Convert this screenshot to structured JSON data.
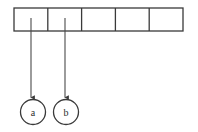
{
  "figure": {
    "kind": "array-with-pointer-nodes-diagram",
    "canvas": {
      "width": 198,
      "height": 132,
      "background": "#ffffff"
    },
    "style": {
      "stroke_color": "#3a3a3a",
      "stroke_color_light": "#4a4a4a",
      "cell_fill": "#ffffff",
      "node_fill": "#ffffff",
      "label_color": "#2e2e2e",
      "stroke_width": 1.3,
      "pointer_stroke_width": 1.1,
      "label_font_size": 10
    },
    "array": {
      "name": "slot-array",
      "x": 14,
      "y": 8,
      "width": 169,
      "height": 23,
      "cell_count": 5,
      "cell_width": 33.8,
      "divider_x": [
        47.8,
        81.6,
        115.4,
        149.2
      ],
      "cells": [
        {
          "index": 0,
          "label": "",
          "center_x": 30.9
        },
        {
          "index": 1,
          "label": "",
          "center_x": 64.7
        },
        {
          "index": 2,
          "label": "",
          "center_x": 98.5
        },
        {
          "index": 3,
          "label": "",
          "center_x": 132.3
        },
        {
          "index": 4,
          "label": "",
          "center_x": 166.1
        }
      ]
    },
    "pointers": [
      {
        "name": "pointer-arrow-a",
        "from_cell_index": 0,
        "x": 31,
        "y_start": 18,
        "y_end": 98,
        "arrowhead": "down",
        "target_node": "a"
      },
      {
        "name": "pointer-arrow-b",
        "from_cell_index": 1,
        "x": 65,
        "y_start": 18,
        "y_end": 98,
        "arrowhead": "down",
        "target_node": "b"
      }
    ],
    "nodes": [
      {
        "name": "node-a",
        "label": "a",
        "cx": 33,
        "cy": 112,
        "r": 12.5
      },
      {
        "name": "node-b",
        "label": "b",
        "cx": 66,
        "cy": 112,
        "r": 12.5
      }
    ]
  }
}
